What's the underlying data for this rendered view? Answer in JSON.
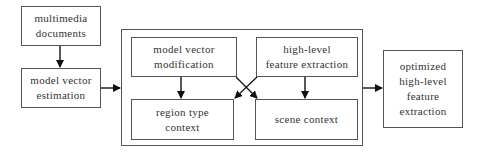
{
  "diagram": {
    "nodes": {
      "multimedia_documents": {
        "label": "multimedia\ndocuments"
      },
      "model_vector_estimation": {
        "label": "model vector\nestimation"
      },
      "model_vector_modification": {
        "label": "model vector\nmodification"
      },
      "high_level_feature_extraction": {
        "label": "high-level\nfeature extraction"
      },
      "region_type_context": {
        "label": "region type\ncontext"
      },
      "scene_context": {
        "label": "scene context"
      },
      "optimized_output": {
        "label": "optimized\nhigh-level\nfeature\nextraction"
      }
    },
    "edges": [
      {
        "from": "multimedia_documents",
        "to": "model_vector_estimation"
      },
      {
        "from": "model_vector_estimation",
        "to": "processing_group"
      },
      {
        "from": "model_vector_modification",
        "to": "region_type_context"
      },
      {
        "from": "model_vector_modification",
        "to": "scene_context"
      },
      {
        "from": "high_level_feature_extraction",
        "to": "region_type_context"
      },
      {
        "from": "high_level_feature_extraction",
        "to": "scene_context"
      },
      {
        "from": "processing_group",
        "to": "optimized_output"
      }
    ],
    "colors": {
      "stroke": "#555555",
      "text": "#333333",
      "background": "#ffffff"
    }
  }
}
